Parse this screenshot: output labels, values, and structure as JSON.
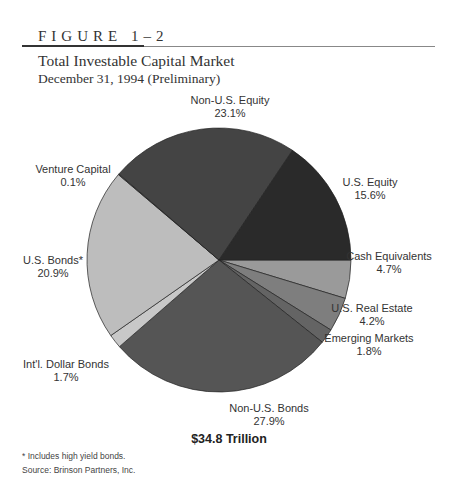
{
  "figure_label": "FIGURE 1–2",
  "chart_data": {
    "type": "pie",
    "title": "Total Investable Capital Market",
    "subtitle": "December 31, 1994 (Preliminary)",
    "total_label": "$34.8 Trillion",
    "start": "3 o'clock, clockwise",
    "slices": [
      {
        "name": "Cash Equivalents",
        "value": 4.7,
        "label": "4.7%",
        "color": "#9a9a9a"
      },
      {
        "name": "U.S. Real Estate",
        "value": 4.2,
        "label": "4.2%",
        "color": "#7e7e7e"
      },
      {
        "name": "Emerging Markets",
        "value": 1.8,
        "label": "1.8%",
        "color": "#646464"
      },
      {
        "name": "Non-U.S. Bonds",
        "value": 27.9,
        "label": "27.9%",
        "color": "#555555"
      },
      {
        "name": "Int'l. Dollar Bonds",
        "value": 1.7,
        "label": "1.7%",
        "color": "#c8c8c8"
      },
      {
        "name": "U.S. Bonds*",
        "value": 20.9,
        "label": "20.9%",
        "color": "#bdbdbd"
      },
      {
        "name": "Venture Capital",
        "value": 0.1,
        "label": "0.1%",
        "color": "#6a6a6a"
      },
      {
        "name": "Non-U.S. Equity",
        "value": 23.1,
        "label": "23.1%",
        "color": "#444444"
      },
      {
        "name": "U.S. Equity",
        "value": 15.6,
        "label": "15.6%",
        "color": "#2a2a2a"
      }
    ]
  },
  "footnote": "* Includes high yield bonds.",
  "source": "Source: Brinson Partners, Inc."
}
